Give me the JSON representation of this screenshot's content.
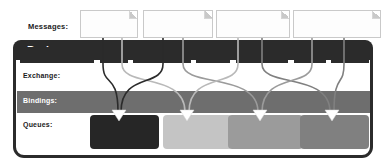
{
  "diagram": {
    "row_labels": {
      "messages": "Messages:",
      "exchange": "Exchange:",
      "bindings": "Bindings:",
      "queues": "Queues:"
    },
    "broker_title": "Broker"
  },
  "messages": [
    {
      "caption": "routing key =",
      "prefix": "usa.",
      "suffix": "news",
      "x": 80,
      "width": 58
    },
    {
      "caption": "routing key =",
      "prefix": "usa.",
      "suffix": "weather",
      "x": 143,
      "width": 70
    },
    {
      "caption": "routing key =",
      "prefix": "europe.",
      "suffix": "news",
      "x": 216,
      "width": 74
    },
    {
      "caption": "routing key =",
      "prefix": "europe.",
      "suffix": "weather",
      "x": 293,
      "width": 88
    }
  ],
  "exchange_slabs": [
    {
      "x": 20,
      "width": 74
    },
    {
      "x": 100,
      "width": 28
    },
    {
      "x": 133,
      "width": 58
    },
    {
      "x": 196,
      "width": 34
    },
    {
      "x": 236,
      "width": 52
    },
    {
      "x": 294,
      "width": 32
    },
    {
      "x": 331,
      "width": 38
    }
  ],
  "queues": [
    {
      "caption": "binding key =",
      "key": "usa.#",
      "x": 90,
      "width": 69,
      "bg": "#262626",
      "caption_color": "#8f8f8f",
      "key_color": "#ffffff"
    },
    {
      "caption": "binding key =",
      "key": "#.news",
      "x": 163,
      "width": 69,
      "bg": "#c4c4c4",
      "caption_color": "#dedede",
      "key_color": "#f2f2f2"
    },
    {
      "caption": "binding key =",
      "key": "#.weather",
      "x": 228,
      "width": 75,
      "bg": "#9b9b9b",
      "caption_color": "#c2c2c2",
      "key_color": "#fcfcfc"
    },
    {
      "caption": "binding key =",
      "key": "europe.#",
      "x": 300,
      "width": 69,
      "bg": "#808080",
      "caption_color": "#b0b0b0",
      "key_color": "#ffffff"
    }
  ],
  "routes": [
    {
      "from": "usa.news",
      "to": "usa.#",
      "color": "#2b2b2b",
      "sx": 103,
      "ex": 118
    },
    {
      "from": "usa.news",
      "to": "#.news",
      "color": "#b9b9b9",
      "sx": 122,
      "ex": 185
    },
    {
      "from": "usa.weather",
      "to": "usa.#",
      "color": "#2b2b2b",
      "sx": 163,
      "ex": 121
    },
    {
      "from": "usa.weather",
      "to": "#.weather",
      "color": "#9b9b9b",
      "sx": 183,
      "ex": 258
    },
    {
      "from": "europe.news",
      "to": "#.news",
      "color": "#b9b9b9",
      "sx": 238,
      "ex": 189
    },
    {
      "from": "europe.news",
      "to": "europe.#",
      "color": "#808080",
      "sx": 262,
      "ex": 330
    },
    {
      "from": "europe.weather",
      "to": "#.weather",
      "color": "#9b9b9b",
      "sx": 312,
      "ex": 262
    },
    {
      "from": "europe.weather",
      "to": "europe.#",
      "color": "#808080",
      "sx": 344,
      "ex": 334
    }
  ],
  "arrow_markers": [
    {
      "queue": "usa.#",
      "x": 119,
      "color": "#ffffff"
    },
    {
      "queue": "#.news",
      "x": 187,
      "color": "#ffffff"
    },
    {
      "queue": "#.weather",
      "x": 260,
      "color": "#ffffff"
    },
    {
      "queue": "europe.#",
      "x": 332,
      "color": "#ffffff"
    }
  ],
  "colors": {
    "broker_border": "#2b2b2b",
    "broker_header": "#2b2b2b",
    "bindings_band": "#6e6e6e",
    "page_background": "#ffffff"
  }
}
